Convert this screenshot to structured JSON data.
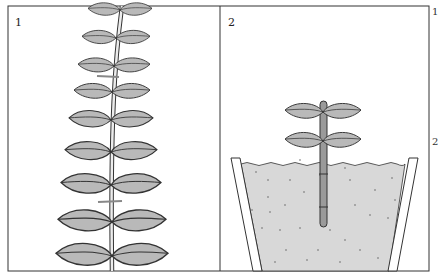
{
  "figure": {
    "panels": [
      {
        "id": "1",
        "label": "1",
        "subject": "leafy-stem-with-cut-marks"
      },
      {
        "id": "2",
        "label": "2",
        "subject": "cutting-in-pot-of-compost"
      }
    ],
    "margin_labels": [
      "1",
      "2"
    ]
  },
  "colors": {
    "leaf_fill": "#b9b9b9",
    "soil_fill": "#d8d8d8",
    "stroke": "#333333",
    "cut_mark": "#888888",
    "background": "#ffffff"
  }
}
